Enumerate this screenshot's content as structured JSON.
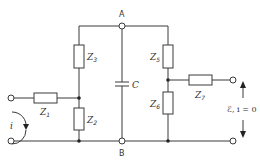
{
  "diagram": {
    "type": "circuit",
    "nodes": {
      "A": {
        "label": "A"
      },
      "B": {
        "label": "B"
      }
    },
    "components": [
      {
        "id": "Z1",
        "symbol": "Z",
        "sub": "1",
        "kind": "impedance",
        "orientation": "horizontal"
      },
      {
        "id": "Z2",
        "symbol": "Z",
        "sub": "2",
        "kind": "impedance",
        "orientation": "vertical"
      },
      {
        "id": "Z3",
        "symbol": "Z",
        "sub": "3",
        "kind": "impedance",
        "orientation": "vertical"
      },
      {
        "id": "Z5",
        "symbol": "Z",
        "sub": "5",
        "kind": "impedance",
        "orientation": "vertical"
      },
      {
        "id": "Z6",
        "symbol": "Z",
        "sub": "6",
        "kind": "impedance",
        "orientation": "vertical"
      },
      {
        "id": "Z7",
        "symbol": "Z",
        "sub": "7",
        "kind": "impedance",
        "orientation": "horizontal"
      },
      {
        "id": "C",
        "symbol": "C",
        "kind": "capacitor",
        "orientation": "vertical"
      }
    ],
    "annotations": {
      "input_current": "i",
      "output": "ℰ, i = 0"
    },
    "colors": {
      "line": "#3a3a3a",
      "background": "#ffffff"
    }
  }
}
